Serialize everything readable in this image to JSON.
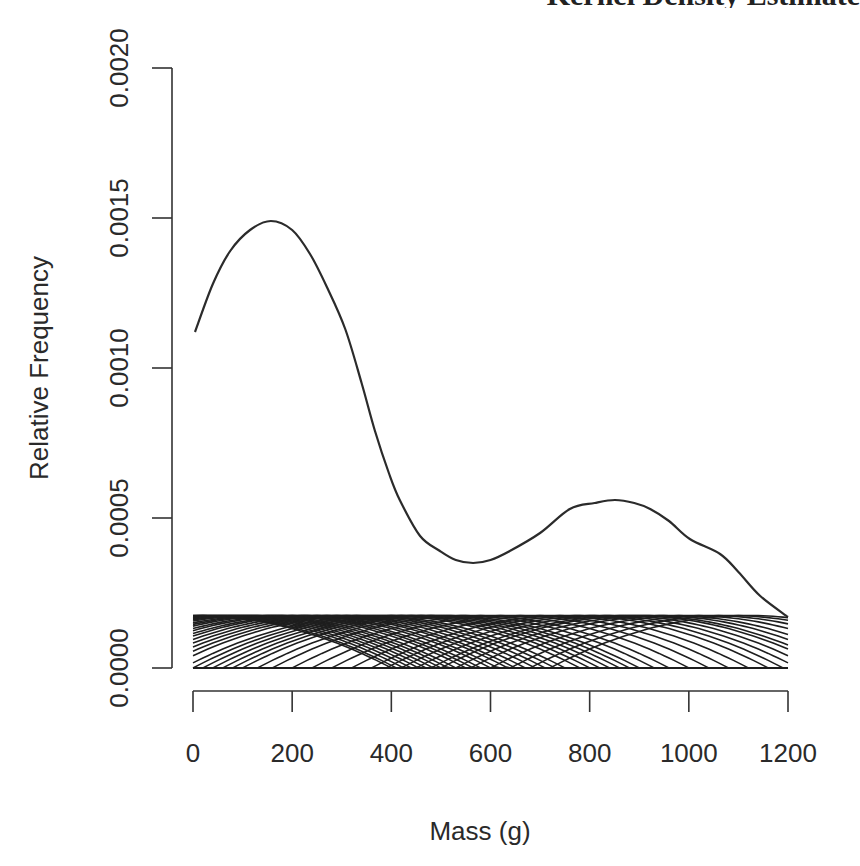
{
  "chart_data": {
    "type": "line",
    "title": "Kernel Density Estimate",
    "title_visible_fragment": "Estimate",
    "xlabel": "Mass (g)",
    "ylabel": "Relative Frequency",
    "xlim": [
      0,
      1200
    ],
    "ylim": [
      0,
      0.002
    ],
    "x_ticks": [
      0,
      200,
      400,
      600,
      800,
      1000,
      1200
    ],
    "x_tick_labels": [
      "0",
      "200",
      "400",
      "600",
      "800",
      "1000",
      "1200"
    ],
    "y_ticks": [
      0,
      0.0005,
      0.001,
      0.0015,
      0.002
    ],
    "y_tick_labels": [
      "0.0000",
      "0.0005",
      "0.0010",
      "0.0015",
      "0.0020"
    ],
    "grid": false,
    "legend": null,
    "series": [
      {
        "name": "density estimate",
        "x": [
          4,
          40,
          75,
          115,
          157,
          200,
          236,
          270,
          307,
          340,
          367,
          395,
          417,
          458,
          498,
          530,
          565,
          600,
          639,
          700,
          760,
          810,
          851,
          890,
          922,
          960,
          1002,
          1063,
          1100,
          1144,
          1200
        ],
        "y": [
          0.00112,
          0.00128,
          0.00139,
          0.00146,
          0.00149,
          0.00146,
          0.00138,
          0.00127,
          0.00113,
          0.00095,
          0.00079,
          0.00065,
          0.00056,
          0.00044,
          0.00039,
          0.00036,
          0.00035,
          0.00036,
          0.00039,
          0.00045,
          0.00053,
          0.00055,
          0.00056,
          0.00055,
          0.00053,
          0.00049,
          0.00043,
          0.00038,
          0.00032,
          0.00024,
          0.00017
        ]
      }
    ],
    "kernels": {
      "description": "individual scaled kernel bumps (one per observation), parabolic/Epanechnikov-like, clipped to [0,1200]",
      "peak_height": 0.000175,
      "half_width": 400,
      "centers": [
        0,
        10,
        25,
        40,
        55,
        70,
        85,
        100,
        115,
        130,
        150,
        165,
        180,
        200,
        215,
        235,
        250,
        270,
        290,
        310,
        330,
        350,
        380,
        400,
        420,
        440,
        460,
        480,
        500,
        530,
        560,
        600,
        640,
        680,
        720,
        760,
        790,
        820,
        850,
        880,
        900,
        930,
        960,
        1000,
        1040,
        1080,
        1120
      ]
    }
  }
}
